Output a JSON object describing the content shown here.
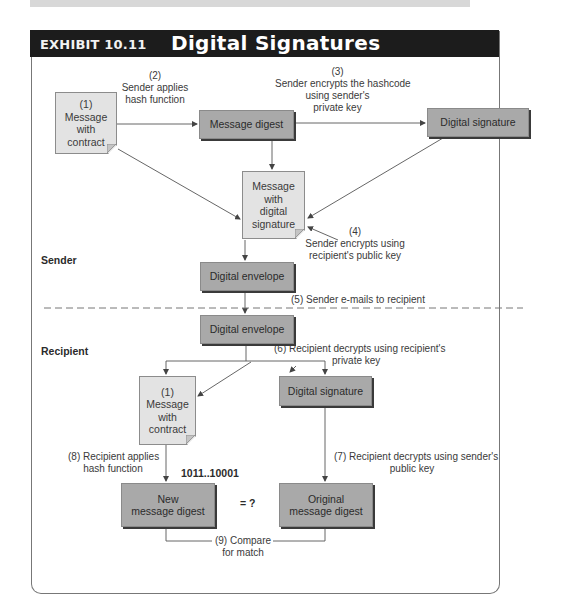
{
  "exhibit": {
    "number_label": "EXHIBIT 10.11",
    "title": "Digital Signatures"
  },
  "sections": {
    "sender": "Sender",
    "recipient": "Recipient"
  },
  "nodes": {
    "sender_message": {
      "step": "(1)",
      "line1": "Message",
      "line2": "with",
      "line3": "contract"
    },
    "message_digest": "Message digest",
    "sender_digital_signature": "Digital signature",
    "message_with_signature": {
      "line1": "Message",
      "line2": "with",
      "line3": "digital",
      "line4": "signature"
    },
    "sender_envelope": "Digital envelope",
    "recipient_envelope": "Digital envelope",
    "recipient_message": {
      "step": "(1)",
      "line1": "Message",
      "line2": "with",
      "line3": "contract"
    },
    "recipient_digital_signature": "Digital signature",
    "new_digest": {
      "line1": "New",
      "line2": "message digest"
    },
    "original_digest": {
      "line1": "Original",
      "line2": "message digest"
    }
  },
  "steps": {
    "s2": {
      "num": "(2)",
      "line1": "Sender applies",
      "line2": "hash function"
    },
    "s3": {
      "num": "(3)",
      "line1": "Sender encrypts the hashcode",
      "line2": "using sender's",
      "line3": "private key"
    },
    "s4": {
      "num": "(4)",
      "line1": "Sender encrypts using",
      "line2": "recipient's public key"
    },
    "s5": "(5) Sender e-mails to recipient",
    "s6": {
      "line1": "(6) Recipient decrypts using recipient's",
      "line2": "private key"
    },
    "s7": {
      "line1": "(7) Recipient decrypts using sender's",
      "line2": "public key"
    },
    "s8": {
      "line1": "(8) Recipient applies",
      "line2": "hash function"
    },
    "s9": {
      "line1": "(9) Compare",
      "line2": "for match"
    }
  },
  "hash_value": "1011..10001",
  "compare_symbol": "= ?",
  "colors": {
    "header_bg": "#1c1c1c",
    "process_box": "#a9a9a9",
    "document_box": "#e3e3e3",
    "line": "#555555"
  }
}
